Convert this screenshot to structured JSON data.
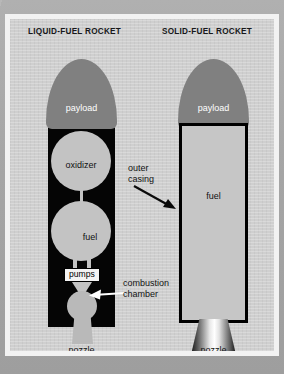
{
  "figure": {
    "left_title": "LIQUID-FUEL ROCKET",
    "right_title": "SOLID-FUEL ROCKET",
    "caption_partial": "",
    "colors": {
      "panel_background": "#cfcfcf",
      "frame": "#f2f2f2",
      "outer_margin": "#a9a9a9",
      "payload_fill": "#808080",
      "body_fill_liquid": "#050505",
      "tank_fill": "#c3c3c3",
      "casing_fill": "#c6c6c6",
      "casing_outline": "#000000",
      "label_text": "#111111",
      "payload_text": "#ffffff"
    }
  },
  "liquid_rocket": {
    "payload_label": "payload",
    "oxidizer_label": "oxidizer",
    "fuel_label": "fuel",
    "pumps_label": "pumps",
    "nozzle_label": "nozzle",
    "callout": {
      "line1": "combustion",
      "line2": "chamber"
    }
  },
  "solid_rocket": {
    "payload_label": "payload",
    "fuel_label": "fuel",
    "nozzle_label": "nozzle",
    "callout": {
      "line1": "outer",
      "line2": "casing"
    }
  }
}
